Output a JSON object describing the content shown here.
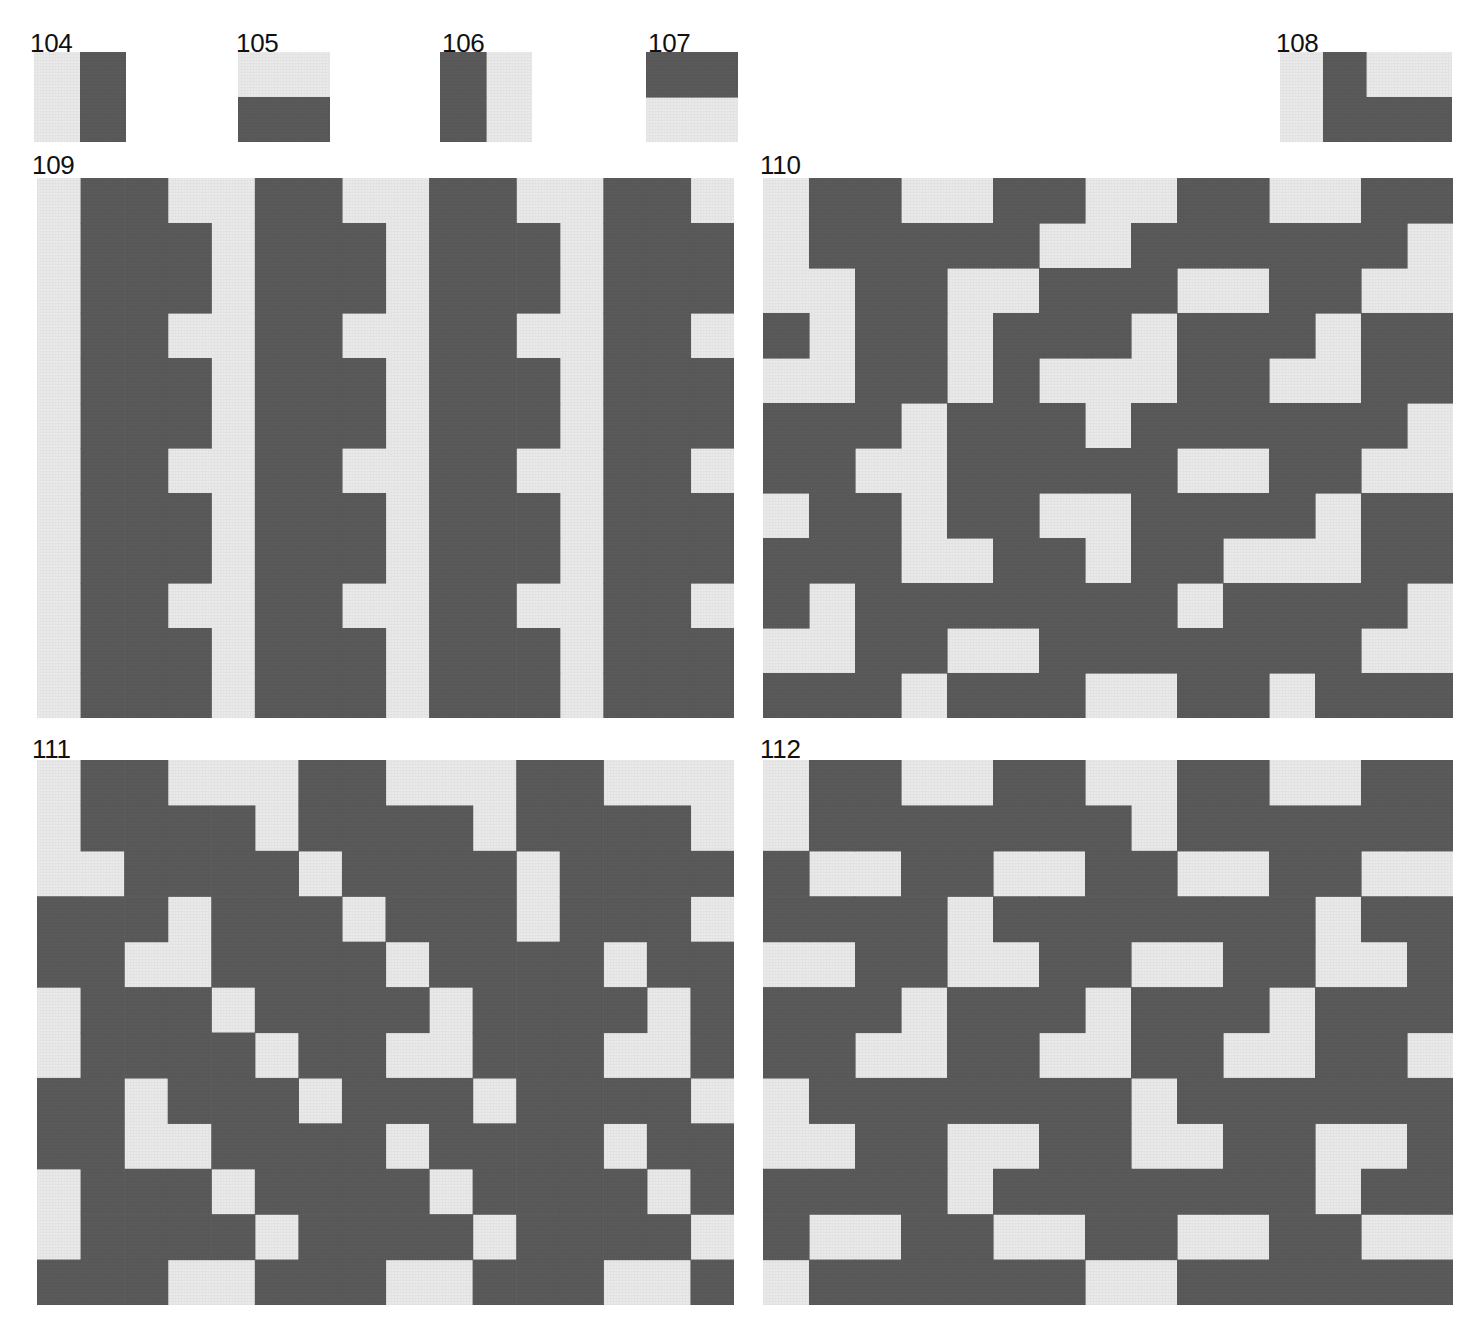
{
  "plate": {
    "title": "Geometric tile pattern plate",
    "background_color": "#ffffff",
    "dark_color": "#5a5a5a",
    "light_color": "#e9e9e9",
    "cell_size": 45
  },
  "swatches": [
    {
      "number": "104",
      "label_x": 30,
      "label_y": 30,
      "x": 34,
      "y": 52,
      "w": 92,
      "h": 90,
      "cols": 2,
      "rows": 2,
      "description": "vertical half: light left, dark right",
      "cells": [
        [
          0,
          1
        ],
        [
          0,
          1
        ]
      ]
    },
    {
      "number": "105",
      "label_x": 236,
      "label_y": 30,
      "x": 238,
      "y": 52,
      "w": 92,
      "h": 90,
      "cols": 2,
      "rows": 2,
      "description": "horizontal half: light top, dark bottom",
      "cells": [
        [
          0,
          0
        ],
        [
          1,
          1
        ]
      ]
    },
    {
      "number": "106",
      "label_x": 442,
      "label_y": 30,
      "x": 440,
      "y": 52,
      "w": 92,
      "h": 90,
      "cols": 2,
      "rows": 2,
      "description": "vertical half: dark left, light right",
      "cells": [
        [
          1,
          0
        ],
        [
          1,
          0
        ]
      ]
    },
    {
      "number": "107",
      "label_x": 648,
      "label_y": 30,
      "x": 646,
      "y": 52,
      "w": 92,
      "h": 90,
      "cols": 2,
      "rows": 2,
      "description": "horizontal half: dark top, light bottom",
      "cells": [
        [
          1,
          1
        ],
        [
          0,
          0
        ]
      ]
    },
    {
      "number": "108",
      "label_x": 1276,
      "label_y": 30,
      "x": 1280,
      "y": 52,
      "w": 172,
      "h": 90,
      "cols": 4,
      "rows": 2,
      "description": "L-shaped tromino: dark vertical bar plus dark horizontal foot on light ground",
      "cells": [
        [
          0,
          1,
          0,
          0
        ],
        [
          0,
          1,
          1,
          1
        ]
      ]
    }
  ],
  "panels": [
    {
      "number": "109",
      "label_x": 32,
      "label_y": 152,
      "x": 37,
      "y": 178,
      "w": 697,
      "h": 540,
      "cols": 16,
      "rows": 12,
      "cell": 45,
      "description": "Comb / E-shaped motif: continuous vertical dark spines with alternating horizontal teeth, repeated four times across",
      "grid": [
        [
          0,
          1,
          1,
          0,
          0,
          1,
          1,
          0,
          0,
          1,
          1,
          0,
          0,
          1,
          1,
          0
        ],
        [
          0,
          1,
          1,
          1,
          0,
          1,
          1,
          1,
          0,
          1,
          1,
          1,
          0,
          1,
          1,
          1
        ],
        [
          0,
          1,
          1,
          1,
          0,
          1,
          1,
          1,
          0,
          1,
          1,
          1,
          0,
          1,
          1,
          1
        ],
        [
          0,
          1,
          1,
          0,
          0,
          1,
          1,
          0,
          0,
          1,
          1,
          0,
          0,
          1,
          1,
          0
        ],
        [
          0,
          1,
          1,
          1,
          0,
          1,
          1,
          1,
          0,
          1,
          1,
          1,
          0,
          1,
          1,
          1
        ],
        [
          0,
          1,
          1,
          1,
          0,
          1,
          1,
          1,
          0,
          1,
          1,
          1,
          0,
          1,
          1,
          1
        ],
        [
          0,
          1,
          1,
          0,
          0,
          1,
          1,
          0,
          0,
          1,
          1,
          0,
          0,
          1,
          1,
          0
        ],
        [
          0,
          1,
          1,
          1,
          0,
          1,
          1,
          1,
          0,
          1,
          1,
          1,
          0,
          1,
          1,
          1
        ],
        [
          0,
          1,
          1,
          1,
          0,
          1,
          1,
          1,
          0,
          1,
          1,
          1,
          0,
          1,
          1,
          1
        ],
        [
          0,
          1,
          1,
          0,
          0,
          1,
          1,
          0,
          0,
          1,
          1,
          0,
          0,
          1,
          1,
          0
        ],
        [
          0,
          1,
          1,
          1,
          0,
          1,
          1,
          1,
          0,
          1,
          1,
          1,
          0,
          1,
          1,
          1
        ],
        [
          0,
          1,
          1,
          1,
          0,
          1,
          1,
          1,
          0,
          1,
          1,
          1,
          0,
          1,
          1,
          1
        ]
      ]
    },
    {
      "number": "110",
      "label_x": 760,
      "label_y": 152,
      "x": 763,
      "y": 178,
      "w": 690,
      "h": 540,
      "cols": 15,
      "rows": 12,
      "cell": 46,
      "description": "Interlocking L-tromino mosaic with staggered offsets, dense woven appearance",
      "grid": [
        [
          0,
          1,
          1,
          0,
          0,
          1,
          1,
          0,
          0,
          1,
          1,
          0,
          0,
          1,
          1
        ],
        [
          0,
          1,
          1,
          1,
          1,
          1,
          0,
          0,
          1,
          1,
          1,
          1,
          1,
          1,
          0
        ],
        [
          0,
          0,
          1,
          1,
          0,
          0,
          1,
          1,
          1,
          0,
          0,
          1,
          1,
          0,
          0
        ],
        [
          1,
          0,
          1,
          1,
          0,
          1,
          1,
          1,
          0,
          1,
          1,
          1,
          0,
          1,
          1
        ],
        [
          0,
          0,
          1,
          1,
          0,
          1,
          0,
          0,
          0,
          1,
          1,
          0,
          0,
          1,
          1
        ],
        [
          1,
          1,
          1,
          0,
          1,
          1,
          1,
          0,
          1,
          1,
          1,
          1,
          1,
          1,
          0
        ],
        [
          1,
          1,
          0,
          0,
          1,
          1,
          1,
          1,
          1,
          0,
          0,
          1,
          1,
          0,
          0
        ],
        [
          0,
          1,
          1,
          0,
          1,
          1,
          0,
          0,
          1,
          1,
          1,
          1,
          0,
          1,
          1
        ],
        [
          1,
          1,
          1,
          0,
          0,
          1,
          1,
          0,
          1,
          1,
          0,
          0,
          0,
          1,
          1
        ],
        [
          1,
          0,
          1,
          1,
          1,
          1,
          1,
          1,
          1,
          0,
          1,
          1,
          1,
          1,
          0
        ],
        [
          0,
          0,
          1,
          1,
          0,
          0,
          1,
          1,
          1,
          1,
          1,
          1,
          1,
          0,
          0
        ],
        [
          1,
          1,
          1,
          0,
          1,
          1,
          1,
          0,
          0,
          1,
          1,
          0,
          1,
          1,
          1
        ]
      ]
    },
    {
      "number": "111",
      "label_x": 32,
      "label_y": 736,
      "x": 37,
      "y": 760,
      "w": 697,
      "h": 545,
      "cols": 16,
      "rows": 12,
      "cell": 45,
      "description": "Diagonal zigzag staircase bands descending left to right",
      "grid": [
        [
          0,
          1,
          1,
          0,
          0,
          0,
          1,
          1,
          0,
          0,
          0,
          1,
          1,
          0,
          0,
          0
        ],
        [
          0,
          1,
          1,
          1,
          1,
          0,
          1,
          1,
          1,
          1,
          0,
          1,
          1,
          1,
          1,
          0
        ],
        [
          0,
          0,
          1,
          1,
          1,
          1,
          0,
          1,
          1,
          1,
          1,
          0,
          1,
          1,
          1,
          1
        ],
        [
          1,
          1,
          1,
          0,
          1,
          1,
          1,
          0,
          1,
          1,
          1,
          0,
          1,
          1,
          1,
          0
        ],
        [
          1,
          1,
          0,
          0,
          1,
          1,
          1,
          1,
          0,
          1,
          1,
          1,
          1,
          0,
          1,
          1
        ],
        [
          0,
          1,
          1,
          1,
          0,
          1,
          1,
          1,
          1,
          0,
          1,
          1,
          1,
          1,
          0,
          1
        ],
        [
          0,
          1,
          1,
          1,
          1,
          0,
          1,
          1,
          0,
          0,
          1,
          1,
          1,
          0,
          0,
          1
        ],
        [
          1,
          1,
          0,
          1,
          1,
          1,
          0,
          1,
          1,
          1,
          0,
          1,
          1,
          1,
          1,
          0
        ],
        [
          1,
          1,
          0,
          0,
          1,
          1,
          1,
          1,
          0,
          1,
          1,
          1,
          1,
          0,
          1,
          1
        ],
        [
          0,
          1,
          1,
          1,
          0,
          1,
          1,
          1,
          1,
          0,
          1,
          1,
          1,
          1,
          0,
          1
        ],
        [
          0,
          1,
          1,
          1,
          1,
          0,
          1,
          1,
          1,
          1,
          0,
          1,
          1,
          1,
          1,
          0
        ],
        [
          1,
          1,
          1,
          0,
          0,
          1,
          1,
          1,
          0,
          0,
          1,
          1,
          1,
          0,
          0,
          1
        ]
      ]
    },
    {
      "number": "112",
      "label_x": 760,
      "label_y": 736,
      "x": 763,
      "y": 760,
      "w": 690,
      "h": 545,
      "cols": 15,
      "rows": 12,
      "cell": 46,
      "description": "L-tromino tessellation arranged in alternating checker blocks of light and dark",
      "grid": [
        [
          0,
          1,
          1,
          0,
          0,
          1,
          1,
          0,
          0,
          1,
          1,
          0,
          0,
          1,
          1
        ],
        [
          0,
          1,
          1,
          1,
          1,
          1,
          1,
          1,
          0,
          1,
          1,
          1,
          1,
          1,
          1
        ],
        [
          1,
          0,
          0,
          1,
          1,
          0,
          0,
          1,
          1,
          0,
          0,
          1,
          1,
          0,
          0
        ],
        [
          1,
          1,
          1,
          1,
          0,
          1,
          1,
          1,
          1,
          1,
          1,
          1,
          0,
          1,
          1
        ],
        [
          0,
          0,
          1,
          1,
          0,
          0,
          1,
          1,
          0,
          0,
          1,
          1,
          0,
          0,
          1
        ],
        [
          1,
          1,
          1,
          0,
          1,
          1,
          1,
          0,
          1,
          1,
          1,
          0,
          1,
          1,
          1
        ],
        [
          1,
          1,
          0,
          0,
          1,
          1,
          0,
          0,
          1,
          1,
          0,
          0,
          1,
          1,
          0
        ],
        [
          0,
          1,
          1,
          1,
          1,
          1,
          1,
          1,
          0,
          1,
          1,
          1,
          1,
          1,
          1
        ],
        [
          0,
          0,
          1,
          1,
          0,
          0,
          1,
          1,
          0,
          0,
          1,
          1,
          0,
          0,
          1
        ],
        [
          1,
          1,
          1,
          1,
          0,
          1,
          1,
          1,
          1,
          1,
          1,
          1,
          0,
          1,
          1
        ],
        [
          1,
          0,
          0,
          1,
          1,
          0,
          0,
          1,
          1,
          0,
          0,
          1,
          1,
          0,
          0
        ],
        [
          0,
          1,
          1,
          1,
          1,
          1,
          1,
          0,
          0,
          1,
          1,
          1,
          1,
          1,
          1
        ]
      ]
    }
  ]
}
